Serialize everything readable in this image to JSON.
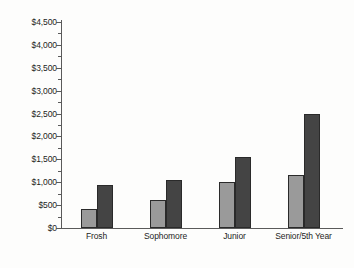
{
  "chart_data": {
    "type": "bar",
    "title": "",
    "subtitle": "",
    "xlabel": "",
    "ylabel": "",
    "categories": [
      "Frosh",
      "Sophomore",
      "Junior",
      "Senior/5th Year"
    ],
    "series": [
      {
        "name": "light-series",
        "color": "#9a9a9a",
        "values": [
          420,
          620,
          1000,
          1150
        ]
      },
      {
        "name": "dark-series",
        "color": "#444444",
        "values": [
          950,
          1050,
          1550,
          2500
        ]
      }
    ],
    "ylim": [
      0,
      4500
    ],
    "ytick_step": 500,
    "ytick_labels": [
      "$0",
      "$500",
      "$1,000",
      "$1,500",
      "$2,000",
      "$2,500",
      "$3,000",
      "$3,500",
      "$4,000",
      "$4,500"
    ],
    "ytick_values": [
      0,
      500,
      1000,
      1500,
      2000,
      2500,
      3000,
      3500,
      4000,
      4500
    ],
    "minor_ticks": true,
    "grid": false,
    "legend": null,
    "legend_position": "none",
    "annotations": []
  },
  "colors": {
    "axis": "#5a5a5a",
    "bar_light": "#9a9a9a",
    "bar_dark": "#444444",
    "bar_outline": "#2a2a2a",
    "text": "#1d1d1d",
    "background": "#fdfdfc"
  }
}
